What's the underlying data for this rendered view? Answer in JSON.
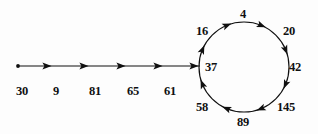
{
  "diagram": {
    "kind": "rho-shaped-functional-graph",
    "title": "",
    "background_color": "#fdfdfd",
    "stroke_color": "#101010",
    "text_color": "#101010",
    "tail": {
      "start_marker": "dot",
      "nodes": [
        {
          "id": "n30",
          "label": "30",
          "x": 16,
          "y": 85,
          "point_x": 18,
          "point_y": 66
        },
        {
          "id": "n9",
          "label": "9",
          "x": 53,
          "y": 85,
          "point_x": 54,
          "point_y": 66
        },
        {
          "id": "n81",
          "label": "81",
          "x": 89,
          "y": 85,
          "point_x": 90,
          "point_y": 66
        },
        {
          "id": "n65",
          "label": "65",
          "x": 127,
          "y": 85,
          "point_x": 127,
          "point_y": 66
        },
        {
          "id": "n61",
          "label": "61",
          "x": 164,
          "y": 85,
          "point_x": 163,
          "point_y": 66
        }
      ],
      "line": {
        "x1": 18,
        "y1": 66,
        "x2": 200,
        "y2": 66
      },
      "arrow_positions_x": [
        47,
        84,
        121,
        158,
        194
      ]
    },
    "cycle": {
      "direction": "counter-clockwise",
      "center_x": 244,
      "center_y": 67,
      "radius": 45,
      "nodes": [
        {
          "id": "c37",
          "label": "37",
          "angle_deg": 180,
          "label_x": 205,
          "label_y": 61
        },
        {
          "id": "c58",
          "label": "58",
          "angle_deg": 225,
          "label_x": 196,
          "label_y": 101
        },
        {
          "id": "c89",
          "label": "89",
          "angle_deg": 270,
          "label_x": 237,
          "label_y": 116
        },
        {
          "id": "c145",
          "label": "145",
          "angle_deg": 315,
          "label_x": 277,
          "label_y": 101
        },
        {
          "id": "c42",
          "label": "42",
          "angle_deg": 0,
          "label_x": 289,
          "label_y": 61
        },
        {
          "id": "c20",
          "label": "20",
          "angle_deg": 45,
          "label_x": 283,
          "label_y": 25
        },
        {
          "id": "c4",
          "label": "4",
          "angle_deg": 90,
          "label_x": 240,
          "label_y": 8
        },
        {
          "id": "c16",
          "label": "16",
          "angle_deg": 135,
          "label_x": 196,
          "label_y": 25
        }
      ],
      "edge_arrow_angles_deg": [
        202,
        247,
        292,
        337,
        22,
        67,
        112,
        157
      ]
    },
    "sequence_text": "30 9 81 65 61 37 58 89 145 42 20 4 16 37"
  }
}
